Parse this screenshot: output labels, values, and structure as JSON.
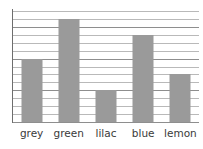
{
  "chart_data": {
    "type": "bar",
    "title": "",
    "xlabel": "",
    "ylabel": "",
    "categories": [
      "grey",
      "green",
      "lilac",
      "blue",
      "lemon"
    ],
    "values": [
      8,
      13,
      4,
      11,
      6
    ],
    "ylim": [
      0,
      14
    ],
    "grid": true,
    "gridline_count": 14,
    "legend": "none",
    "bar_color": "#9a9a9a",
    "gridline_color": "#b9b9b9",
    "axis_color": "#8e8e8e"
  },
  "labels": {
    "cat0": "grey",
    "cat1": "green",
    "cat2": "lilac",
    "cat3": "blue",
    "cat4": "lemon"
  }
}
